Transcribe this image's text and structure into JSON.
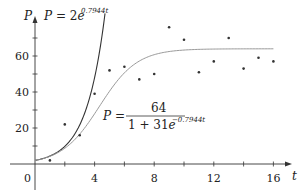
{
  "chart_data": {
    "type": "scatter",
    "title": "",
    "xlabel": "t",
    "ylabel": "P",
    "xlim": [
      0,
      17
    ],
    "ylim": [
      -10,
      80
    ],
    "grid": false,
    "x_ticks": [
      0,
      2,
      4,
      6,
      8,
      10,
      12,
      14,
      16
    ],
    "x_tick_labels": [
      "0",
      "",
      "4",
      "",
      "8",
      "",
      "12",
      "",
      "16"
    ],
    "y_ticks": [
      0,
      10,
      20,
      30,
      40,
      50,
      60,
      70
    ],
    "y_tick_labels": [
      "",
      "",
      "20",
      "",
      "40",
      "",
      "60",
      ""
    ],
    "series": [
      {
        "name": "data",
        "kind": "scatter",
        "x": [
          1,
          2,
          3,
          4,
          5,
          6,
          7,
          8,
          9,
          10,
          11,
          12,
          13,
          14,
          15,
          16
        ],
        "y": [
          2,
          22,
          16,
          39,
          52,
          54,
          47,
          50,
          76,
          69,
          51,
          57,
          70,
          53,
          59,
          57
        ]
      },
      {
        "name": "exponential",
        "kind": "line",
        "formula": "P = 2e^(0.7944t)",
        "a": 2,
        "k": 0.7944,
        "t_range": [
          0,
          4.9
        ]
      },
      {
        "name": "logistic",
        "kind": "line",
        "formula": "P = 64 / (1 + 31e^(-0.7944t))",
        "M": 64,
        "A": 31,
        "k": 0.7944,
        "t_range": [
          0,
          16
        ]
      }
    ],
    "annotations": [
      {
        "text_main": "P = 2e",
        "text_sup": "0.7944t",
        "near": "exponential"
      },
      {
        "lhs": "P =",
        "numerator": "64",
        "denominator_main": "1 + 31e",
        "denominator_sup": "−0.7944t",
        "near": "logistic"
      }
    ]
  },
  "labels": {
    "origin": "0",
    "x_axis_var": "t",
    "y_axis_var": "P"
  }
}
